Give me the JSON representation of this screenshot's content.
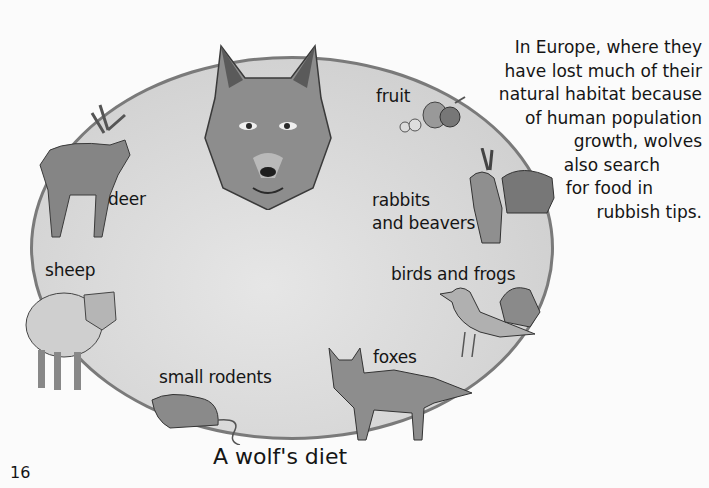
{
  "page": {
    "number": "16",
    "caption": "A wolf's diet"
  },
  "diagram": {
    "center": "wolf",
    "prey_labels": {
      "fruit": "fruit",
      "rabbits": "rabbits",
      "beavers": "and beavers",
      "birds_frogs": "birds and frogs",
      "foxes": "foxes",
      "rodents": "small rodents",
      "sheep": "sheep",
      "deer": "deer"
    }
  },
  "sidebar": {
    "lines": [
      "In Europe, where they",
      "have lost much of their",
      "natural habitat because",
      "of human population",
      "growth, wolves",
      "also search",
      "for food in",
      "rubbish tips."
    ]
  },
  "colors": {
    "ellipse_fill": "#d5d5d5",
    "ellipse_border": "#7a7a7a",
    "background": "#fbfbfb"
  }
}
